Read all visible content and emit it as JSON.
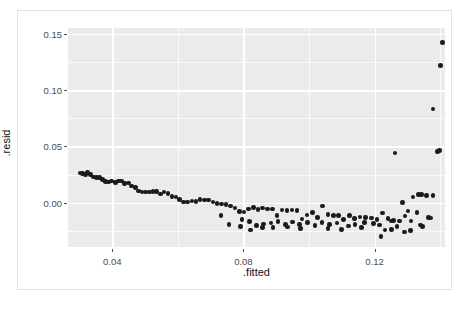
{
  "chart_data": {
    "type": "scatter",
    "title": "",
    "xlabel": ".fitted",
    "ylabel": ".resid",
    "xlim": [
      0.0265,
      0.1415
    ],
    "ylim": [
      -0.0395,
      0.1555
    ],
    "grid": true,
    "legend": null,
    "x_ticks": [
      0.04,
      0.08,
      0.12
    ],
    "x_tick_labels": [
      "0.04",
      "0.08",
      "0.12"
    ],
    "x_minor_ticks": [
      0.06,
      0.1,
      0.14
    ],
    "y_ticks": [
      0.0,
      0.05,
      0.1,
      0.15
    ],
    "y_tick_labels": [
      "0.00",
      "0.05",
      "0.10",
      "0.15"
    ],
    "y_minor_ticks": [
      -0.025,
      0.025,
      0.075,
      0.125
    ],
    "panel_background": "#ebebeb",
    "grid_color": "#ffffff",
    "point_color": "#1a1a1a",
    "point_size": 4.6,
    "points": [
      [
        0.0302,
        0.0265
      ],
      [
        0.031,
        0.0262
      ],
      [
        0.0318,
        0.0248
      ],
      [
        0.0325,
        0.0268
      ],
      [
        0.0334,
        0.025
      ],
      [
        0.0343,
        0.0228
      ],
      [
        0.0352,
        0.0222
      ],
      [
        0.0361,
        0.0222
      ],
      [
        0.037,
        0.0208
      ],
      [
        0.038,
        0.0186
      ],
      [
        0.0389,
        0.0185
      ],
      [
        0.0398,
        0.0192
      ],
      [
        0.0409,
        0.018
      ],
      [
        0.0419,
        0.0194
      ],
      [
        0.0428,
        0.0192
      ],
      [
        0.0438,
        0.0172
      ],
      [
        0.0449,
        0.0174
      ],
      [
        0.0459,
        0.0148
      ],
      [
        0.047,
        0.0133
      ],
      [
        0.048,
        0.0104
      ],
      [
        0.0491,
        0.0094
      ],
      [
        0.0502,
        0.0093
      ],
      [
        0.0513,
        0.0094
      ],
      [
        0.0524,
        0.01
      ],
      [
        0.0535,
        0.0097
      ],
      [
        0.0547,
        0.0078
      ],
      [
        0.0558,
        0.0096
      ],
      [
        0.057,
        0.0083
      ],
      [
        0.0582,
        0.0057
      ],
      [
        0.0594,
        0.005
      ],
      [
        0.0606,
        0.003
      ],
      [
        0.0618,
        0.0006
      ],
      [
        0.063,
        0.0004
      ],
      [
        0.0643,
        0.0013
      ],
      [
        0.0655,
        0.001
      ],
      [
        0.0668,
        0.0029
      ],
      [
        0.0681,
        0.0025
      ],
      [
        0.0694,
        0.0022
      ],
      [
        0.0707,
        0.0004
      ],
      [
        0.072,
        -0.0008
      ],
      [
        0.0733,
        -0.0012
      ],
      [
        0.0747,
        -0.0016
      ],
      [
        0.076,
        -0.003
      ],
      [
        0.0774,
        -0.0046
      ],
      [
        0.0788,
        -0.0078
      ],
      [
        0.0802,
        -0.0082
      ],
      [
        0.0816,
        -0.0056
      ],
      [
        0.083,
        -0.0042
      ],
      [
        0.0845,
        -0.006
      ],
      [
        0.0859,
        -0.0048
      ],
      [
        0.0874,
        -0.0058
      ],
      [
        0.0888,
        -0.0057
      ],
      [
        0.0903,
        -0.0112
      ],
      [
        0.0918,
        -0.0065
      ],
      [
        0.0933,
        -0.0071
      ],
      [
        0.0948,
        -0.0064
      ],
      [
        0.0963,
        -0.007
      ],
      [
        0.0979,
        -0.0144
      ],
      [
        0.0994,
        -0.011
      ],
      [
        0.101,
        -0.0089
      ],
      [
        0.1026,
        -0.0131
      ],
      [
        0.1042,
        -0.003
      ],
      [
        0.1058,
        -0.0104
      ],
      [
        0.1074,
        -0.0116
      ],
      [
        0.109,
        -0.0112
      ],
      [
        0.1106,
        -0.0152
      ],
      [
        0.1123,
        -0.0112
      ],
      [
        0.1139,
        -0.014
      ],
      [
        0.1156,
        -0.0129
      ],
      [
        0.1173,
        -0.013
      ],
      [
        0.119,
        -0.0136
      ],
      [
        0.1207,
        -0.015
      ],
      [
        0.1224,
        -0.0092
      ],
      [
        0.1241,
        -0.0139
      ],
      [
        0.1258,
        -0.016
      ],
      [
        0.1276,
        -0.0162
      ],
      [
        0.1293,
        -0.012
      ],
      [
        0.1311,
        -0.0163
      ],
      [
        0.1329,
        -0.009
      ],
      [
        0.1347,
        -0.0212
      ],
      [
        0.1365,
        -0.0131
      ],
      [
        0.117,
        -0.0175
      ],
      [
        0.1196,
        -0.0186
      ],
      [
        0.1215,
        -0.0198
      ],
      [
        0.1232,
        -0.0245
      ],
      [
        0.125,
        -0.0165
      ],
      [
        0.1268,
        -0.0215
      ],
      [
        0.112,
        -0.0208
      ],
      [
        0.114,
        -0.0196
      ],
      [
        0.116,
        -0.0223
      ],
      [
        0.1085,
        -0.0182
      ],
      [
        0.1062,
        -0.0196
      ],
      [
        0.104,
        -0.0178
      ],
      [
        0.1018,
        -0.0205
      ],
      [
        0.0996,
        -0.0178
      ],
      [
        0.0972,
        -0.0196
      ],
      [
        0.095,
        -0.0172
      ],
      [
        0.0928,
        -0.0194
      ],
      [
        0.0906,
        -0.0168
      ],
      [
        0.0884,
        -0.0183
      ],
      [
        0.0862,
        -0.0192
      ],
      [
        0.084,
        -0.0204
      ],
      [
        0.0818,
        -0.0168
      ],
      [
        0.0796,
        -0.0152
      ],
      [
        0.1285,
        0.0
      ],
      [
        0.1302,
        -0.0074
      ],
      [
        0.1318,
        0.005
      ],
      [
        0.1334,
        0.0073
      ],
      [
        0.1344,
        0.0074
      ],
      [
        0.1358,
        0.0065
      ],
      [
        0.1378,
        0.0063
      ],
      [
        0.1292,
        -0.026
      ],
      [
        0.131,
        -0.0247
      ],
      [
        0.134,
        -0.0198
      ],
      [
        0.1372,
        -0.0135
      ],
      [
        0.1262,
        0.0442
      ],
      [
        0.1392,
        0.0455
      ],
      [
        0.1398,
        0.0466
      ],
      [
        0.1378,
        0.0832
      ],
      [
        0.1402,
        0.122
      ],
      [
        0.1408,
        0.1428
      ],
      [
        0.122,
        -0.0302
      ],
      [
        0.1252,
        -0.024
      ],
      [
        0.11,
        -0.024
      ],
      [
        0.1058,
        -0.0232
      ],
      [
        0.0975,
        -0.0231
      ],
      [
        0.0935,
        -0.0218
      ],
      [
        0.089,
        -0.0219
      ],
      [
        0.0858,
        -0.0224
      ],
      [
        0.0822,
        -0.0245
      ],
      [
        0.0792,
        -0.0213
      ],
      [
        0.0756,
        -0.0195
      ],
      [
        0.0732,
        -0.0112
      ]
    ]
  }
}
